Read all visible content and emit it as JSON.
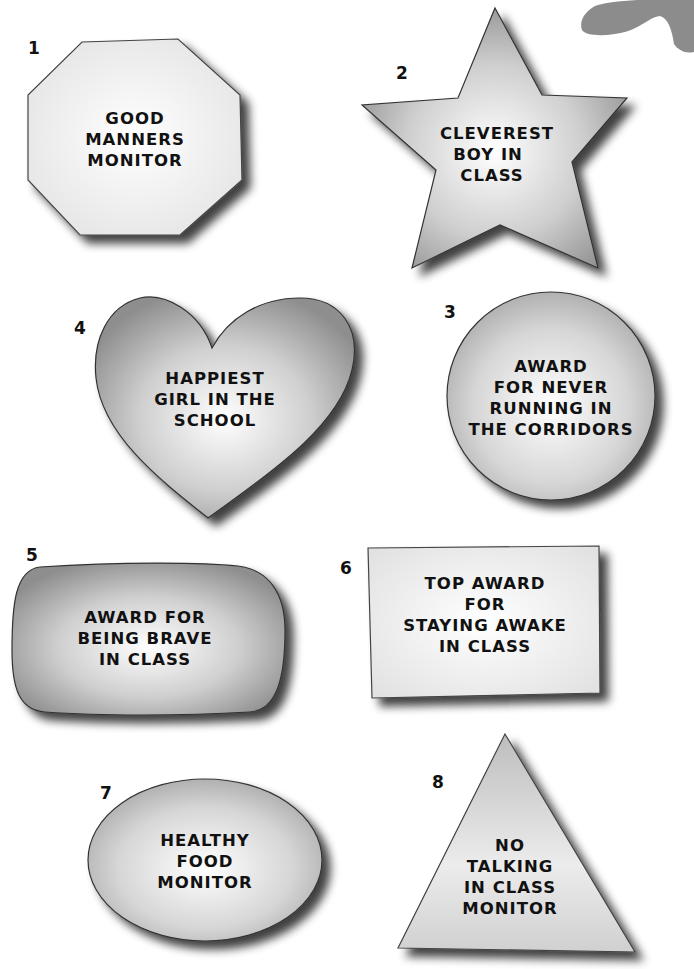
{
  "page": {
    "colors": {
      "background": "#ffffff",
      "badge_edge": "#222222",
      "badge_light": "#f7f7f7",
      "badge_dark": "#8a8a8a",
      "shadow": "#555555",
      "blob": "#8c8c8c"
    }
  },
  "badges": [
    {
      "number": "1",
      "shape": "octagon",
      "lines": [
        "GOOD",
        "MANNERS",
        "MONITOR"
      ]
    },
    {
      "number": "2",
      "shape": "star",
      "lines": [
        "CLEVEREST",
        "BOY IN",
        "CLASS"
      ]
    },
    {
      "number": "3",
      "shape": "circle",
      "lines": [
        "AWARD",
        "FOR NEVER",
        "RUNNING IN",
        "THE CORRIDORS"
      ]
    },
    {
      "number": "4",
      "shape": "heart",
      "lines": [
        "HAPPIEST",
        "GIRL IN THE",
        "SCHOOL"
      ]
    },
    {
      "number": "5",
      "shape": "rounded-rectangle",
      "lines": [
        "AWARD FOR",
        "BEING BRAVE",
        "IN CLASS"
      ]
    },
    {
      "number": "6",
      "shape": "rectangle",
      "lines": [
        "TOP AWARD",
        "FOR",
        "STAYING AWAKE",
        "IN CLASS"
      ]
    },
    {
      "number": "7",
      "shape": "oval",
      "lines": [
        "HEALTHY",
        "FOOD",
        "MONITOR"
      ]
    },
    {
      "number": "8",
      "shape": "triangle",
      "lines": [
        "NO",
        "TALKING",
        "IN CLASS",
        "MONITOR"
      ]
    }
  ]
}
